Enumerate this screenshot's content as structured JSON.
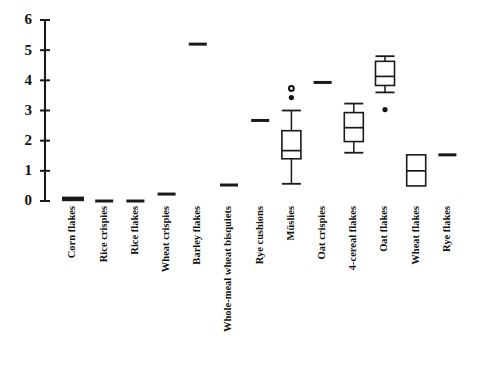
{
  "chart_data": {
    "type": "box",
    "title": "",
    "subtitle": "",
    "xlabel": "",
    "ylabel": "",
    "ylim": [
      0,
      6
    ],
    "yticks": [
      0,
      1,
      2,
      3,
      4,
      5,
      6
    ],
    "ytick_labels": [
      "0",
      "1",
      "2",
      "3",
      "4",
      "5",
      "6"
    ],
    "grid": false,
    "legend": "none",
    "orientation": "vertical",
    "axis_color": "#1a1a1a",
    "box_fill": "#ffffff",
    "box_edge": "#1a1a1a",
    "categories": [
      "Corn flakes",
      "Rice crispies",
      "Rice flakes",
      "Wheat crispies",
      "Barley flakes",
      "Whole-meal wheat bisquiets",
      "Rye cushions",
      "Müslies",
      "Oat crispies",
      "4-cereal flakes",
      "Oat flakes",
      "Wheat flakes",
      "Rye flakes"
    ],
    "boxes": [
      {
        "label": "Corn flakes",
        "render": "line",
        "emphasis": "thick",
        "median": 0.07,
        "q1": 0.07,
        "q3": 0.07,
        "whisker_low": 0.07,
        "whisker_high": 0.07,
        "outliers": []
      },
      {
        "label": "Rice crispies",
        "render": "line",
        "emphasis": "normal",
        "median": 0.0,
        "q1": 0.0,
        "q3": 0.0,
        "whisker_low": 0.0,
        "whisker_high": 0.0,
        "outliers": []
      },
      {
        "label": "Rice flakes",
        "render": "line",
        "emphasis": "normal",
        "median": 0.0,
        "q1": 0.0,
        "q3": 0.0,
        "whisker_low": 0.0,
        "whisker_high": 0.0,
        "outliers": []
      },
      {
        "label": "Wheat crispies",
        "render": "line",
        "emphasis": "normal",
        "median": 0.23,
        "q1": 0.23,
        "q3": 0.23,
        "whisker_low": 0.23,
        "whisker_high": 0.23,
        "outliers": []
      },
      {
        "label": "Barley flakes",
        "render": "line",
        "emphasis": "normal",
        "median": 5.2,
        "q1": 5.2,
        "q3": 5.2,
        "whisker_low": 5.2,
        "whisker_high": 5.2,
        "outliers": []
      },
      {
        "label": "Whole-meal wheat bisquiets",
        "render": "line",
        "emphasis": "normal",
        "median": 0.53,
        "q1": 0.53,
        "q3": 0.53,
        "whisker_low": 0.53,
        "whisker_high": 0.53,
        "outliers": []
      },
      {
        "label": "Rye cushions",
        "render": "line",
        "emphasis": "normal",
        "median": 2.67,
        "q1": 2.67,
        "q3": 2.67,
        "whisker_low": 2.67,
        "whisker_high": 2.67,
        "outliers": []
      },
      {
        "label": "Müslies",
        "render": "box",
        "emphasis": "normal",
        "median": 1.67,
        "q1": 1.4,
        "q3": 2.33,
        "whisker_low": 0.57,
        "whisker_high": 3.0,
        "outliers": [
          3.43,
          3.73
        ]
      },
      {
        "label": "Oat crispies",
        "render": "line",
        "emphasis": "normal",
        "median": 3.93,
        "q1": 3.93,
        "q3": 3.93,
        "whisker_low": 3.93,
        "whisker_high": 3.93,
        "outliers": []
      },
      {
        "label": "4-cereal flakes",
        "render": "box",
        "emphasis": "normal",
        "median": 2.43,
        "q1": 1.97,
        "q3": 2.93,
        "whisker_low": 1.6,
        "whisker_high": 3.23,
        "outliers": []
      },
      {
        "label": "Oat flakes",
        "render": "box",
        "emphasis": "normal",
        "median": 4.13,
        "q1": 3.83,
        "q3": 4.63,
        "whisker_low": 3.6,
        "whisker_high": 4.8,
        "outliers": [
          3.03
        ]
      },
      {
        "label": "Wheat flakes",
        "render": "box",
        "emphasis": "normal",
        "median": 1.0,
        "q1": 0.5,
        "q3": 1.53,
        "whisker_low": 0.5,
        "whisker_high": 1.53,
        "outliers": []
      },
      {
        "label": "Rye flakes",
        "render": "line",
        "emphasis": "normal",
        "median": 1.53,
        "q1": 1.53,
        "q3": 1.53,
        "whisker_low": 1.53,
        "whisker_high": 1.53,
        "outliers": []
      }
    ]
  },
  "layout": {
    "plot_left": 45,
    "plot_right": 472,
    "plot_top": 20,
    "plot_bottom": 201,
    "axis_x": 45,
    "first_category_x": 73,
    "category_spacing": 31.2,
    "label_top": 206,
    "box_width": 19,
    "line_half_width": 9,
    "line_half_width_thick": 11
  }
}
